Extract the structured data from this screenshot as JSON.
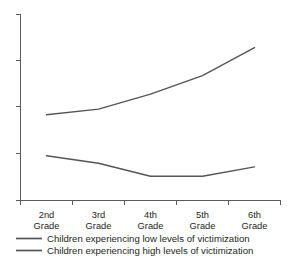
{
  "chart_data": {
    "type": "line",
    "title": "",
    "subtitle": "",
    "xlabel": "",
    "ylabel": "",
    "grid": false,
    "legend_position": "bottom",
    "axis": {
      "y_tick_labels": [
        "",
        "",
        "",
        "",
        ""
      ],
      "y_tick_count": 5,
      "ylim": [
        0,
        100
      ],
      "x_tick_labels_shown": true
    },
    "categories": [
      "2nd Grade",
      "3rd Grade",
      "4th Grade",
      "5th Grade",
      "6th Grade"
    ],
    "category_lines": [
      [
        "2nd",
        "Grade"
      ],
      [
        "3rd",
        "Grade"
      ],
      [
        "4th",
        "Grade"
      ],
      [
        "5th",
        "Grade"
      ],
      [
        "6th",
        "Grade"
      ]
    ],
    "series": [
      {
        "name": "Children experiencing low levels of victimization",
        "color": "#555555",
        "values": [
          46,
          49,
          57,
          67,
          82
        ]
      },
      {
        "name": "Children experiencing high levels of victimization",
        "color": "#555555",
        "values": [
          24,
          20,
          13,
          13,
          18
        ]
      }
    ]
  },
  "legend": {
    "items": [
      {
        "label": "Children experiencing low levels of victimization",
        "color": "#555555"
      },
      {
        "label": "Children experiencing high levels of victimization",
        "color": "#555555"
      }
    ]
  },
  "colors": {
    "axis": "#5a5a5a",
    "text": "#231f20",
    "background": "#ffffff",
    "series_low": "#555555",
    "series_high": "#555555"
  }
}
